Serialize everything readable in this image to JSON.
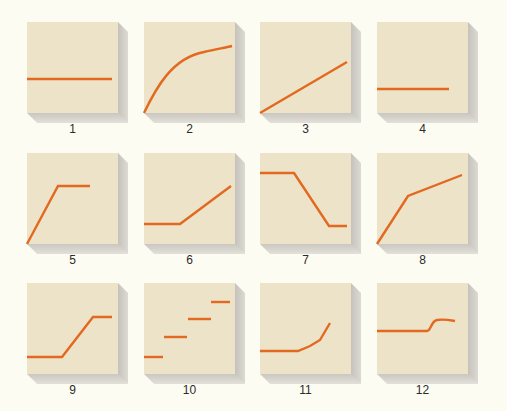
{
  "figure": {
    "background": "#fdfcf3",
    "panel_color": "#ede3c8",
    "line_color": "#e2691f",
    "panels": [
      {
        "label": "1",
        "shape": "horizontal-line-mid"
      },
      {
        "label": "2",
        "shape": "concave-increasing-curve"
      },
      {
        "label": "3",
        "shape": "linear-increase"
      },
      {
        "label": "4",
        "shape": "horizontal-line-low"
      },
      {
        "label": "5",
        "shape": "rise-then-plateau"
      },
      {
        "label": "6",
        "shape": "flat-then-rise"
      },
      {
        "label": "7",
        "shape": "flat-decline-flat"
      },
      {
        "label": "8",
        "shape": "steep-rise-then-gentle-rise"
      },
      {
        "label": "9",
        "shape": "flat-rise-flat"
      },
      {
        "label": "10",
        "shape": "step-increases"
      },
      {
        "label": "11",
        "shape": "flat-then-accelerating-rise"
      },
      {
        "label": "12",
        "shape": "flat-small-jump-flat"
      }
    ]
  }
}
